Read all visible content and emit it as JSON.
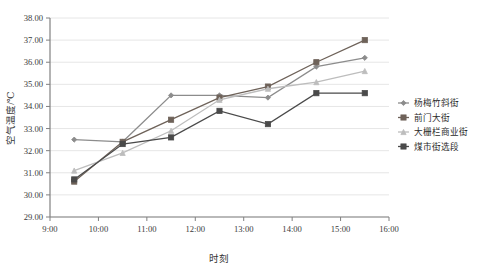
{
  "chart_data": {
    "type": "line",
    "title": "",
    "xlabel": "时刻",
    "ylabel": "空气温度/℃",
    "x": [
      "9:30",
      "10:30",
      "11:30",
      "12:30",
      "13:30",
      "14:30",
      "15:30"
    ],
    "x_numeric": [
      9.5,
      10.5,
      11.5,
      12.5,
      13.5,
      14.5,
      15.5
    ],
    "xlim": [
      9,
      16
    ],
    "ylim": [
      29.0,
      38.0
    ],
    "x_ticks": [
      "9:00",
      "10:00",
      "11:00",
      "12:00",
      "13:00",
      "14:00",
      "15:00",
      "16:00"
    ],
    "y_ticks": [
      "29.00",
      "30.00",
      "31.00",
      "32.00",
      "33.00",
      "34.00",
      "35.00",
      "36.00",
      "37.00",
      "38.00"
    ],
    "grid": "horizontal",
    "legend_position": "right",
    "series": [
      {
        "name": "杨梅竹斜街",
        "color": "#8c8c8c",
        "marker": "diamond",
        "values": [
          32.5,
          32.4,
          34.5,
          34.5,
          34.4,
          35.8,
          36.2
        ]
      },
      {
        "name": "前门大街",
        "color": "#6e6259",
        "marker": "square",
        "values": [
          30.6,
          32.4,
          33.4,
          34.4,
          34.9,
          36.0,
          37.0
        ]
      },
      {
        "name": "大栅栏商业街",
        "color": "#bdbdbd",
        "marker": "triangle",
        "values": [
          31.1,
          31.9,
          32.9,
          34.3,
          34.8,
          35.1,
          35.6
        ]
      },
      {
        "name": "煤市街选段",
        "color": "#4a4a4a",
        "marker": "square",
        "values": [
          30.7,
          32.3,
          32.6,
          33.8,
          33.2,
          34.6,
          34.6
        ]
      }
    ]
  },
  "legend": {
    "items": [
      {
        "label": "杨梅竹斜街"
      },
      {
        "label": "前门大街"
      },
      {
        "label": "大栅栏商业街"
      },
      {
        "label": "煤市街选段"
      }
    ]
  },
  "axes": {
    "y_title": "空气温度/℃",
    "x_title": "时刻"
  }
}
